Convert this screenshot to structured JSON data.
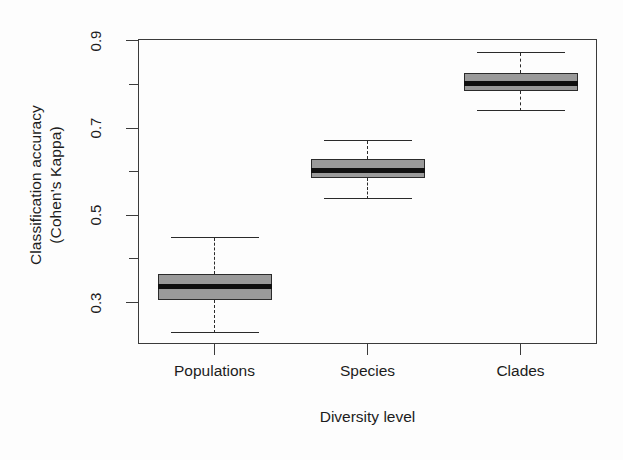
{
  "figure": {
    "width": 623,
    "height": 460,
    "background": "#fdfdfd",
    "frame_color": "#3b3b3b",
    "box_fill": "#9a9a9a",
    "box_border": "#2b2b2b",
    "median_color": "#101010",
    "whisker_color": "#2a2a2a"
  },
  "axes": {
    "y_title_line1": "Classification accuracy",
    "y_title_line2": "(Cohen's Kappa)",
    "x_title": "Diversity level",
    "y_labeled_ticks": [
      "0.3",
      "0.5",
      "0.7",
      "0.9"
    ],
    "y_minor_ticks": [
      "0.4",
      "0.6",
      "0.8"
    ],
    "x_tick_labels": [
      "Populations",
      "Species",
      "Clades"
    ]
  },
  "chart_data": {
    "type": "boxplot",
    "title": "",
    "xlabel": "Diversity level",
    "ylabel": "Classification accuracy (Cohen's Kappa)",
    "categories": [
      "Populations",
      "Species",
      "Clades"
    ],
    "ylim": [
      0.205,
      0.905
    ],
    "ytick_values": [
      0.3,
      0.4,
      0.5,
      0.6,
      0.7,
      0.8,
      0.9
    ],
    "ytick_labels_shown": [
      "0.3",
      "",
      "0.5",
      "",
      "0.7",
      "",
      "0.9"
    ],
    "grid": false,
    "legend": null,
    "boxes": [
      {
        "category": "Populations",
        "lower_whisker": 0.23,
        "q1": 0.307,
        "median": 0.337,
        "q3": 0.366,
        "upper_whisker": 0.448,
        "outliers": []
      },
      {
        "category": "Species",
        "lower_whisker": 0.538,
        "q1": 0.586,
        "median": 0.604,
        "q3": 0.629,
        "upper_whisker": 0.672,
        "outliers": []
      },
      {
        "category": "Clades",
        "lower_whisker": 0.739,
        "q1": 0.785,
        "median": 0.803,
        "q3": 0.828,
        "upper_whisker": 0.873,
        "outliers": []
      }
    ]
  }
}
